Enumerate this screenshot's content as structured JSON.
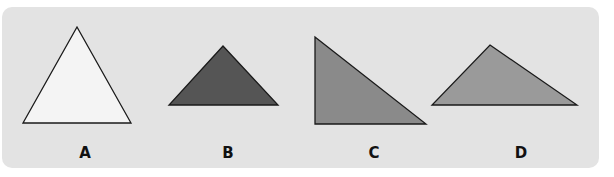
{
  "figure": {
    "background_color": "#e3e3e3",
    "stroke_color": "#1a1a1a",
    "triangles": [
      {
        "label": "A",
        "type": "equilateral",
        "fill": "#f4f4f4",
        "points": "77,27 131,123 23,123",
        "label_x": 85
      },
      {
        "label": "B",
        "type": "isosceles-obtuse",
        "fill": "#555555",
        "points": "223,46 278,105 169,105",
        "label_x": 228
      },
      {
        "label": "C",
        "type": "right",
        "fill": "#8a8a8a",
        "points": "315,37 426,124 315,124",
        "label_x": 374
      },
      {
        "label": "D",
        "type": "scalene-obtuse",
        "fill": "#9a9a9a",
        "points": "490,45 577,105 432,105",
        "label_x": 521
      }
    ]
  }
}
